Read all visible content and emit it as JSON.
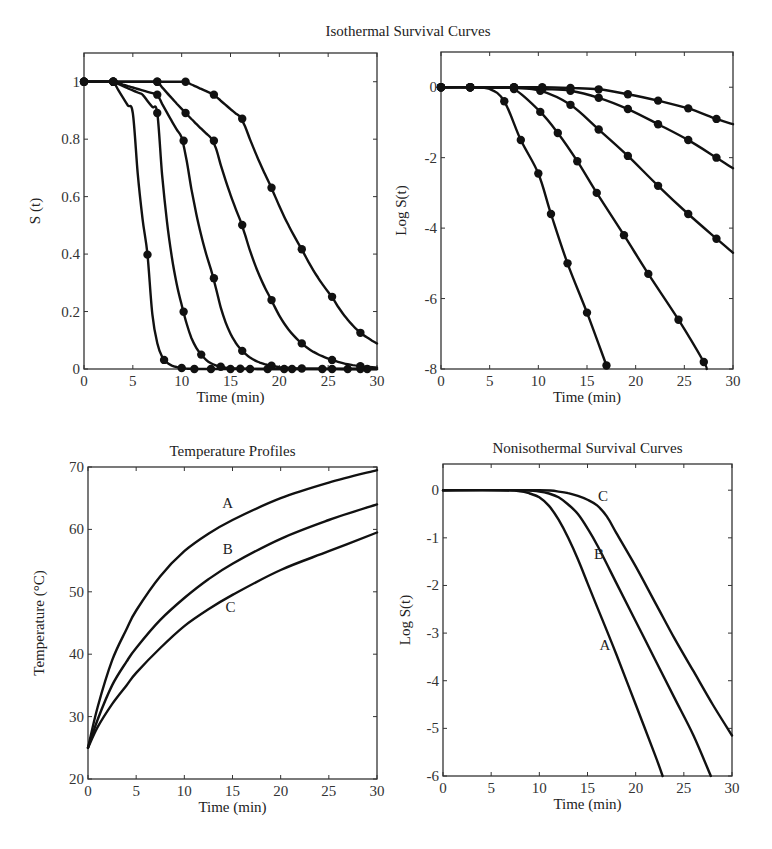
{
  "figure_title": "Isothermal Survival Curves",
  "chart_data": [
    {
      "id": "iso_linear",
      "type": "line",
      "title": "",
      "xlabel": "Time (min)",
      "ylabel": "S (t)",
      "xlim": [
        0,
        30
      ],
      "ylim": [
        0,
        1.1
      ],
      "xticks": [
        0,
        5,
        10,
        15,
        20,
        25,
        30
      ],
      "yticks": [
        0,
        0.2,
        0.4,
        0.6,
        0.8,
        1
      ],
      "ytick_labels": [
        "0",
        "0.2",
        "0.4",
        "0.6",
        "0.8",
        "1"
      ],
      "markers": true,
      "derived_from": "iso_log",
      "frame": {
        "x0": 84,
        "y0": 53,
        "x1": 377,
        "y1": 369
      }
    },
    {
      "id": "iso_log",
      "type": "line",
      "title": "",
      "xlabel": "Time (min)",
      "ylabel": "Log S(t)",
      "xlim": [
        0,
        30
      ],
      "ylim": [
        -8,
        1
      ],
      "xticks": [
        0,
        5,
        10,
        15,
        20,
        25,
        30
      ],
      "yticks": [
        -8,
        -6,
        -4,
        -2,
        0
      ],
      "ytick_labels": [
        "-8",
        "-6",
        "-4",
        "-2",
        "0"
      ],
      "markers": true,
      "frame": {
        "x0": 441,
        "y0": 52,
        "x1": 733,
        "y1": 369
      },
      "series": [
        {
          "name": "curve 1",
          "x": [
            0,
            3,
            5,
            6.5,
            8.2,
            10,
            11.3,
            13,
            15,
            17
          ],
          "y": [
            0,
            0,
            -0.05,
            -0.4,
            -1.5,
            -2.45,
            -3.6,
            -5.0,
            -6.4,
            -7.9
          ],
          "marker_x": [
            0,
            3,
            6.5,
            8.2,
            10,
            11.3,
            13,
            15,
            17
          ]
        },
        {
          "name": "curve 2",
          "x": [
            0,
            3,
            6,
            7.5,
            10.2,
            12,
            14,
            16,
            18.8,
            21.3,
            24.4,
            27,
            27.3
          ],
          "y": [
            0,
            0,
            -0.02,
            -0.05,
            -0.7,
            -1.3,
            -2.1,
            -3.0,
            -4.2,
            -5.3,
            -6.6,
            -7.8,
            -8
          ],
          "marker_x": [
            0,
            3,
            7.5,
            10.2,
            12,
            14,
            16,
            18.8,
            21.3,
            24.4,
            27
          ]
        },
        {
          "name": "curve 3",
          "x": [
            0,
            3,
            7.5,
            10.2,
            13.3,
            16.2,
            19.2,
            22.3,
            25.4,
            28.3,
            30
          ],
          "y": [
            0,
            0,
            -0.02,
            -0.1,
            -0.5,
            -1.2,
            -1.95,
            -2.8,
            -3.6,
            -4.3,
            -4.7
          ],
          "marker_x": [
            0,
            3,
            7.5,
            10.2,
            13.3,
            16.2,
            19.2,
            22.3,
            25.4,
            28.3
          ]
        },
        {
          "name": "curve 4",
          "x": [
            0,
            3,
            7.5,
            10.4,
            13.3,
            16.2,
            19.2,
            22.3,
            25.4,
            28.3,
            30
          ],
          "y": [
            0,
            0,
            0,
            -0.05,
            -0.1,
            -0.3,
            -0.62,
            -1.05,
            -1.5,
            -2.0,
            -2.3
          ],
          "marker_x": [
            0,
            3,
            7.5,
            10.4,
            13.3,
            16.2,
            19.2,
            22.3,
            25.4,
            28.3
          ]
        },
        {
          "name": "curve 5",
          "x": [
            0,
            3,
            7.5,
            10.4,
            13.3,
            16.2,
            19.2,
            22.3,
            25.4,
            28.3,
            30
          ],
          "y": [
            0,
            0,
            0,
            0,
            -0.02,
            -0.06,
            -0.2,
            -0.38,
            -0.6,
            -0.9,
            -1.05
          ],
          "marker_x": [
            0,
            3,
            7.5,
            10.4,
            13.3,
            16.2,
            19.2,
            22.3,
            25.4,
            28.3
          ]
        }
      ]
    },
    {
      "id": "temp_profiles",
      "type": "line",
      "title": "Temperature Profiles",
      "xlabel": "Time (min)",
      "ylabel": "Temperature (°C)",
      "xlim": [
        0,
        30
      ],
      "ylim": [
        20,
        70
      ],
      "xticks": [
        0,
        5,
        10,
        15,
        20,
        25,
        30
      ],
      "yticks": [
        20,
        30,
        40,
        50,
        60,
        70
      ],
      "ytick_labels": [
        "20",
        "30",
        "40",
        "50",
        "60",
        "70"
      ],
      "markers": false,
      "frame": {
        "x0": 88,
        "y0": 467,
        "x1": 377,
        "y1": 779
      },
      "series": [
        {
          "name": "A",
          "x": [
            0,
            1,
            2.5,
            4,
            5,
            7.5,
            10,
            12.5,
            15,
            20,
            25,
            30
          ],
          "y": [
            25,
            31.5,
            39,
            44,
            47,
            52.5,
            56.5,
            59.3,
            61.5,
            65,
            67.5,
            69.5
          ],
          "label_at": [
            14.5,
            63.5
          ]
        },
        {
          "name": "B",
          "x": [
            0,
            1,
            2.5,
            4,
            5,
            7.5,
            10,
            12.5,
            15,
            20,
            25,
            30
          ],
          "y": [
            25,
            29.5,
            35,
            38.8,
            41,
            45.5,
            49,
            52,
            54.5,
            58.5,
            61.5,
            64
          ],
          "label_at": [
            14.5,
            56
          ]
        },
        {
          "name": "C",
          "x": [
            0,
            1,
            2.5,
            4,
            5,
            7.5,
            10,
            12.5,
            15,
            20,
            25,
            30
          ],
          "y": [
            25,
            28.3,
            32,
            35,
            37,
            41,
            44.5,
            47.2,
            49.5,
            53.5,
            56.5,
            59.5
          ],
          "label_at": [
            14.8,
            46.8
          ]
        }
      ]
    },
    {
      "id": "noniso_log",
      "type": "line",
      "title": "Nonisothermal Survival Curves",
      "xlabel": "Time (min)",
      "ylabel": "Log S(t)",
      "xlim": [
        0,
        30
      ],
      "ylim": [
        -6,
        0.55
      ],
      "xticks": [
        0,
        5,
        10,
        15,
        20,
        25,
        30
      ],
      "yticks": [
        -6,
        -5,
        -4,
        -3,
        -2,
        -1,
        0
      ],
      "ytick_labels": [
        "-6",
        "-5",
        "-4",
        "-3",
        "-2",
        "-1",
        "0"
      ],
      "markers": false,
      "frame": {
        "x0": 443,
        "y0": 464,
        "x1": 732,
        "y1": 776
      },
      "series": [
        {
          "name": "A",
          "x": [
            0,
            6,
            8,
            9,
            10,
            11,
            12,
            13,
            14,
            15,
            16,
            18,
            20,
            22,
            22.8
          ],
          "y": [
            0,
            0,
            -0.02,
            -0.07,
            -0.15,
            -0.33,
            -0.62,
            -1.0,
            -1.45,
            -1.95,
            -2.45,
            -3.45,
            -4.5,
            -5.55,
            -6
          ],
          "label_at": [
            16.8,
            -3.35
          ]
        },
        {
          "name": "B",
          "x": [
            0,
            8,
            10,
            11,
            12,
            13,
            14,
            15,
            16,
            18,
            20,
            22,
            24,
            26,
            27.8
          ],
          "y": [
            0,
            0,
            -0.03,
            -0.07,
            -0.15,
            -0.3,
            -0.5,
            -0.8,
            -1.15,
            -1.95,
            -2.75,
            -3.55,
            -4.35,
            -5.15,
            -6
          ],
          "label_at": [
            16.2,
            -1.45
          ]
        },
        {
          "name": "C",
          "x": [
            0,
            10,
            12,
            13,
            14,
            15,
            16,
            17,
            18,
            20,
            22,
            24,
            26,
            28,
            30
          ],
          "y": [
            0,
            0,
            -0.03,
            -0.06,
            -0.12,
            -0.2,
            -0.32,
            -0.55,
            -0.9,
            -1.6,
            -2.35,
            -3.1,
            -3.8,
            -4.5,
            -5.15
          ],
          "label_at": [
            16.6,
            -0.22
          ]
        }
      ]
    }
  ]
}
